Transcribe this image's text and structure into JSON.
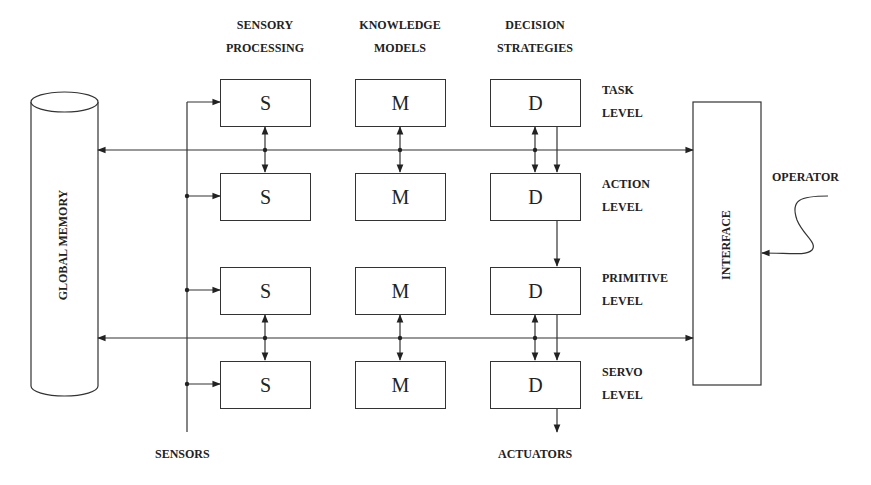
{
  "diagram": {
    "type": "hierarchical control system architecture",
    "column_headers": [
      {
        "line1": "SENSORY",
        "line2": "PROCESSING"
      },
      {
        "line1": "KNOWLEDGE",
        "line2": "MODELS"
      },
      {
        "line1": "DECISION",
        "line2": "STRATEGIES"
      }
    ],
    "levels": [
      {
        "line1": "TASK",
        "line2": "LEVEL"
      },
      {
        "line1": "ACTION",
        "line2": "LEVEL"
      },
      {
        "line1": "PRIMITIVE",
        "line2": "LEVEL"
      },
      {
        "line1": "SERVO",
        "line2": "LEVEL"
      }
    ],
    "module_letters": {
      "sensory": "S",
      "model": "M",
      "decision": "D"
    },
    "global_memory": "GLOBAL MEMORY",
    "interface": "INTERFACE",
    "operator": "OPERATOR",
    "sensors": "SENSORS",
    "actuators": "ACTUATORS",
    "line_color": "#333333"
  }
}
